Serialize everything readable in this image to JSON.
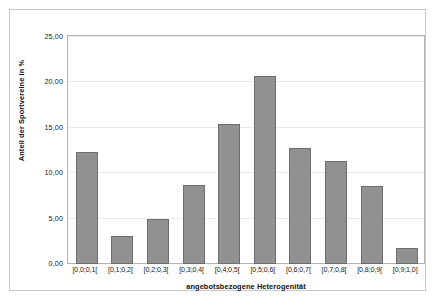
{
  "chart_data": {
    "type": "bar",
    "title": "",
    "subtitle": "",
    "xlabel": "angebotsbezogene Heterogenität",
    "ylabel": "Anteil der Sportvereine in %",
    "categories": [
      "[0,0;0,1[",
      "[0,1;0,2[",
      "[0,2;0,3[",
      "[0,3;0,4[",
      "[0,4;0,5[",
      "[0,5;0,6[",
      "[0,6;0,7[",
      "[0,7;0,8[",
      "[0,8;0,9[",
      "[0,9;1,0]"
    ],
    "values": [
      12.3,
      3.1,
      5.0,
      8.7,
      15.4,
      20.7,
      12.8,
      11.4,
      8.6,
      1.8
    ],
    "ylim": [
      0,
      25
    ],
    "ytick_values": [
      0,
      5,
      10,
      15,
      20,
      25
    ],
    "ytick_labels": [
      "0,00",
      "5,00",
      "10,00",
      "15,00",
      "20,00",
      "25,00"
    ],
    "grid": true,
    "legend": false,
    "bar_color": "#919191",
    "bar_edge_color": "#6d6d6d",
    "grid_color": "#eceaea",
    "axis_color": "#b4b4b4",
    "frame_color": "#c9c9c9",
    "background_color": "#ffffff"
  }
}
